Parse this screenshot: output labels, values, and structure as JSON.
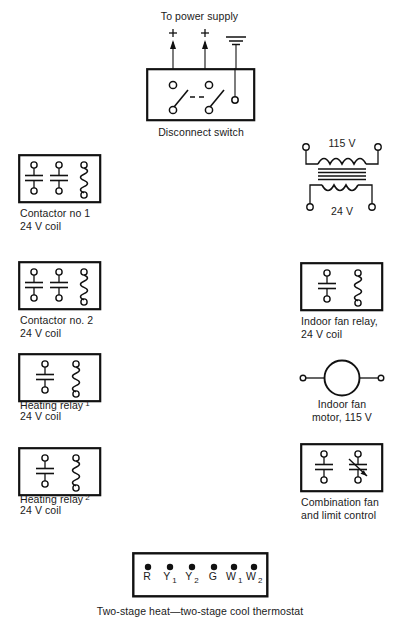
{
  "diagram": {
    "background_color": "#ffffff",
    "line_color": "#111111"
  },
  "power_supply": {
    "label": "To power supply",
    "terminal_marks": [
      "+",
      "+"
    ],
    "ground_icon": "ground-icon"
  },
  "disconnect_switch": {
    "caption": "Disconnect switch",
    "poles": 2,
    "ground_terminal": true
  },
  "components": {
    "contactor_1": {
      "caption_line1": "Contactor no 1",
      "caption_line2": "24 V coil",
      "contacts": 2,
      "coils": 1
    },
    "contactor_2": {
      "caption_line1": "Contactor no. 2",
      "caption_line2": "24 V coil",
      "contacts": 2,
      "coils": 1
    },
    "heating_relay_1": {
      "caption_line1": "Heating relay",
      "caption_superscript": "1",
      "caption_line2": "24 V coil",
      "contacts": 1,
      "coils": 1
    },
    "heating_relay_2": {
      "caption_line1": "Heating relay",
      "caption_superscript": "2",
      "caption_line2": "24 V coil",
      "contacts": 1,
      "coils": 1
    },
    "transformer": {
      "primary_label": "115 V",
      "secondary_label": "24 V"
    },
    "indoor_fan_relay": {
      "caption_line1": "Indoor fan relay,",
      "caption_line2": "24 V coil",
      "contacts": 1,
      "coils": 1
    },
    "indoor_fan_motor": {
      "caption_line1": "Indoor fan",
      "caption_line2": "motor, 115 V"
    },
    "combination_fan_limit_control": {
      "caption_line1": "Combination fan",
      "caption_line2": "and limit control",
      "contacts": 2
    }
  },
  "thermostat": {
    "caption": "Two-stage heat—two-stage cool thermostat",
    "terminals": [
      {
        "letter": "R",
        "sub": ""
      },
      {
        "letter": "Y",
        "sub": "1"
      },
      {
        "letter": "Y",
        "sub": "2"
      },
      {
        "letter": "G",
        "sub": ""
      },
      {
        "letter": "W",
        "sub": "1"
      },
      {
        "letter": "W",
        "sub": "2"
      }
    ]
  }
}
